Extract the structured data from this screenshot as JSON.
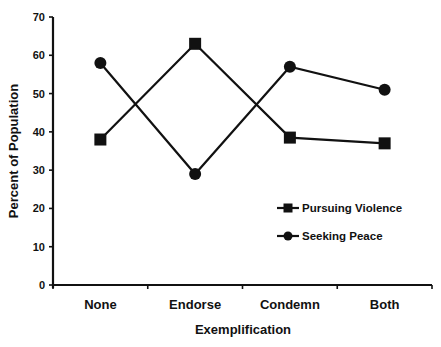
{
  "chart_data": {
    "type": "line",
    "title": "",
    "xlabel": "Exemplification",
    "ylabel": "Percent of Population",
    "categories": [
      "None",
      "Endorse",
      "Condemn",
      "Both"
    ],
    "series": [
      {
        "name": "Pursuing Violence",
        "marker": "square",
        "values": [
          38,
          63,
          38.5,
          37
        ]
      },
      {
        "name": "Seeking Peace",
        "marker": "circle",
        "values": [
          58,
          29,
          57,
          51
        ]
      }
    ],
    "ylim": [
      0,
      70
    ],
    "yticks": [
      0,
      10,
      20,
      30,
      40,
      50,
      60,
      70
    ],
    "grid": false,
    "legend_position": "inside-right",
    "colors": {
      "line": "#111111",
      "background": "#ffffff"
    }
  }
}
